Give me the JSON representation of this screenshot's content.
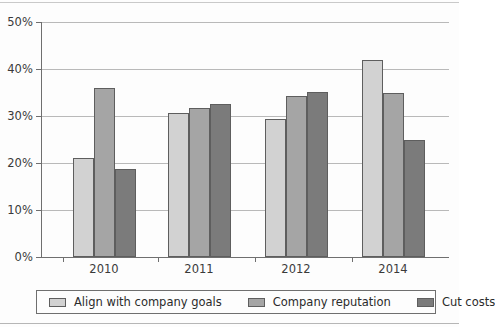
{
  "chart_data": {
    "type": "bar",
    "title": "",
    "subtitle": "",
    "xlabel": "",
    "ylabel": "",
    "categories": [
      "2010",
      "2011",
      "2012",
      "2014"
    ],
    "series": [
      {
        "name": "Align with company goals",
        "color": "#d2d2d2",
        "values": [
          21.0,
          30.6,
          29.4,
          42.0
        ]
      },
      {
        "name": "Company reputation",
        "color": "#a5a5a5",
        "values": [
          36.0,
          31.7,
          34.2,
          35.0
        ]
      },
      {
        "name": "Cut costs",
        "color": "#7b7b7b",
        "values": [
          18.7,
          32.5,
          35.2,
          25.0
        ]
      }
    ],
    "ylim": [
      0,
      50
    ],
    "ytick_values": [
      0,
      10,
      20,
      30,
      40,
      50
    ],
    "ytick_labels": [
      "0%",
      "10%",
      "20%",
      "30%",
      "40%",
      "50%"
    ],
    "grid": true,
    "grid_axis": "y",
    "legend_position": "bottom",
    "value_suffix": "%"
  },
  "legend": {
    "items": [
      {
        "label": "Align with company goals",
        "swatch": "legend-swatch-align-with-company-goals"
      },
      {
        "label": "Company reputation",
        "swatch": "legend-swatch-company-reputation"
      },
      {
        "label": "Cut costs",
        "swatch": "legend-swatch-cut-costs"
      }
    ]
  }
}
